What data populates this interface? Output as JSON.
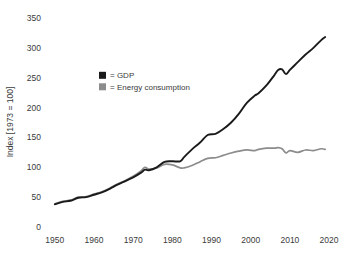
{
  "chart_data": {
    "type": "line",
    "title": "",
    "xlabel": "",
    "ylabel": "Index [1973 = 100]",
    "xlim": [
      1948,
      2021
    ],
    "ylim": [
      0,
      360
    ],
    "grid": false,
    "legend_position": "upper-left-inside",
    "x_ticks": [
      "1950",
      "1960",
      "1970",
      "1980",
      "1990",
      "2000",
      "2010",
      "2020"
    ],
    "x_tick_values": [
      1950,
      1960,
      1970,
      1980,
      1990,
      2000,
      2010,
      2020
    ],
    "y_ticks": [
      "0",
      "50",
      "100",
      "150",
      "200",
      "250",
      "300",
      "350"
    ],
    "y_tick_values": [
      0,
      50,
      100,
      150,
      200,
      250,
      300,
      350
    ],
    "x": [
      1950,
      1952,
      1954,
      1956,
      1958,
      1960,
      1962,
      1964,
      1966,
      1968,
      1970,
      1972,
      1973,
      1974,
      1976,
      1978,
      1980,
      1982,
      1983,
      1985,
      1987,
      1989,
      1991,
      1993,
      1995,
      1997,
      1999,
      2001,
      2002,
      2004,
      2006,
      2007,
      2008,
      2009,
      2010,
      2012,
      2014,
      2016,
      2018,
      2019
    ],
    "series": [
      {
        "name": "GDP",
        "color": "#1a1a1a",
        "legend_marker": "filled-square",
        "values": [
          38,
          42,
          44,
          49,
          50,
          54,
          58,
          64,
          71,
          77,
          83,
          91,
          96,
          95,
          100,
          109,
          110,
          110,
          117,
          130,
          141,
          154,
          156,
          164,
          175,
          190,
          208,
          220,
          224,
          237,
          254,
          263,
          264,
          256,
          263,
          276,
          289,
          300,
          313,
          318
        ]
      },
      {
        "name": "Energy consumption",
        "color": "#8c8c8c",
        "legend_marker": "filled-square",
        "values": [
          39,
          43,
          45,
          50,
          51,
          55,
          59,
          65,
          72,
          78,
          85,
          94,
          100,
          97,
          99,
          105,
          104,
          99,
          99,
          103,
          109,
          115,
          116,
          120,
          124,
          127,
          129,
          128,
          130,
          132,
          132,
          133,
          131,
          124,
          128,
          125,
          129,
          128,
          131,
          130
        ]
      }
    ],
    "legend": [
      {
        "prefix": "=",
        "label": "GDP",
        "color": "#1a1a1a"
      },
      {
        "prefix": "=",
        "label": "Energy consumption",
        "color": "#8c8c8c"
      }
    ]
  }
}
